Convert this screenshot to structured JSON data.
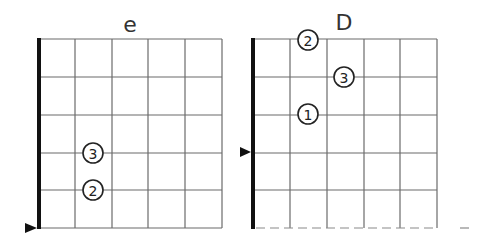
{
  "diagrams": [
    {
      "title": "e",
      "strings": 6,
      "frets": 5,
      "left_edge_marker_row": 5,
      "fingers": [
        {
          "label": "3",
          "string_line": 1,
          "fret_line": 3
        },
        {
          "label": "2",
          "string_line": 1,
          "fret_line": 4
        }
      ],
      "bottom_border": "solid"
    },
    {
      "title": "D",
      "strings": 6,
      "frets": 5,
      "left_edge_marker_row": 3,
      "fingers": [
        {
          "label": "2",
          "string_line": 1,
          "fret_line": 0
        },
        {
          "label": "3",
          "string_line": 2,
          "fret_line": 1
        },
        {
          "label": "1",
          "string_line": 1,
          "fret_line": 2
        }
      ],
      "bottom_border": "dashed"
    }
  ],
  "colors": {
    "grid": "#6b6b6b",
    "nut": "#111111",
    "circle_stroke": "#222222",
    "background": "#ffffff"
  }
}
